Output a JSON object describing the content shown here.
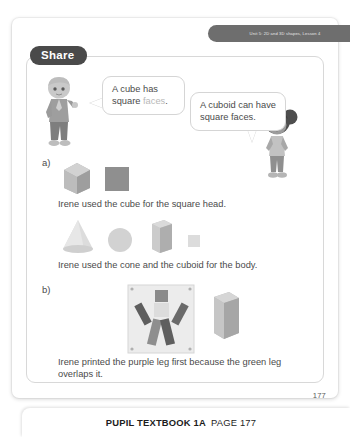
{
  "unit_tab": {
    "text": "Unit 5: 2D and 3D shapes, Lesson 4"
  },
  "section_header": {
    "label": "Share"
  },
  "speech_bubbles": [
    {
      "id": "boy-bubble",
      "text_before": "A cube has square ",
      "highlight": "faces",
      "text_after": ".",
      "full_text": "A cube has square faces."
    },
    {
      "id": "girl-bubble",
      "full_text": "A cuboid can have square faces."
    }
  ],
  "characters": [
    {
      "name": "boy-character",
      "description": "boy pointing"
    },
    {
      "name": "girl-character",
      "description": "girl with hair buns"
    }
  ],
  "parts": [
    {
      "label": "a)",
      "shapes": [
        {
          "name": "cube-3d",
          "type": "cube",
          "fill": "#b9b9b9"
        },
        {
          "name": "square-2d",
          "type": "square",
          "fill": "#8f8f8f"
        }
      ],
      "caption": "Irene used the cube for the square head."
    },
    {
      "label": "",
      "shapes": [
        {
          "name": "cone-3d",
          "type": "cone",
          "fill": "#d8d8d8"
        },
        {
          "name": "circle-2d",
          "type": "circle",
          "fill": "#d0d0d0"
        },
        {
          "name": "cuboid-3d-tall",
          "type": "cuboid",
          "fill": "#c9c9c9"
        },
        {
          "name": "square-2d-small",
          "type": "square-small",
          "fill": "#dcdcdc"
        }
      ],
      "caption": "Irene used the cone and the cuboid for the body."
    },
    {
      "label": "b)",
      "shapes": [
        {
          "name": "printed-figure-photo",
          "type": "photo",
          "fill": "#e8e8e8"
        },
        {
          "name": "cuboid-3d",
          "type": "cuboid",
          "fill": "#c0c0c0"
        }
      ],
      "caption": "Irene printed the purple leg first because the green leg overlaps it."
    }
  ],
  "footer": {
    "page_number": "177",
    "book_label": "PUPIL TEXTBOOK 1A",
    "page_label": "PAGE 177"
  },
  "colors": {
    "tab_bg": "#6e6e6e",
    "badge_bg": "#4a4a4a",
    "text": "#4b4b4b",
    "highlight": "#b8b8b8",
    "card_border": "#d8d8d8"
  }
}
